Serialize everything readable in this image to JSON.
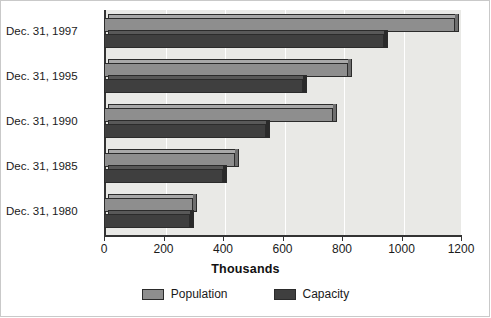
{
  "chart_data": {
    "type": "bar",
    "orientation": "horizontal",
    "title": "",
    "xlabel": "Thousands",
    "ylabel": "",
    "xlim": [
      0,
      1200
    ],
    "xticks": [
      0,
      200,
      400,
      600,
      800,
      1000,
      1200
    ],
    "xtick_labels": [
      "0",
      "200",
      "400",
      "600",
      "800",
      "1000",
      "1200"
    ],
    "grid": true,
    "legend_position": "bottom",
    "categories": [
      "Dec. 31, 1997",
      "Dec. 31, 1995",
      "Dec. 31, 1990",
      "Dec. 31, 1985",
      "Dec. 31, 1980"
    ],
    "series": [
      {
        "name": "Population",
        "color": "#8e8e8e",
        "values": [
          1180,
          820,
          770,
          440,
          300
        ]
      },
      {
        "name": "Capacity",
        "color": "#3f3f3f",
        "values": [
          940,
          670,
          545,
          400,
          290
        ]
      }
    ]
  },
  "legend": {
    "items": [
      {
        "label": "Population",
        "swatch": "#8e8e8e"
      },
      {
        "label": "Capacity",
        "swatch": "#3f3f3f"
      }
    ]
  },
  "axis": {
    "title": "Thousands"
  }
}
